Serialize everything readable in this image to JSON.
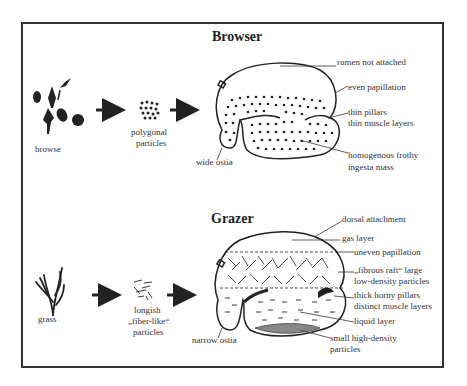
{
  "browser": {
    "title": "Browser",
    "food_label": "browse",
    "particles_label_1": "polygonal",
    "particles_label_2": "particles",
    "annotations": {
      "rumen_not_attached": "rumen not attached",
      "even_papillation": "even papillation",
      "thin_pillars": "thin pillars",
      "thin_muscle_layers": "thin muscle layers",
      "homogenous_1": "homogenous frothy",
      "homogenous_2": "ingesta mass",
      "wide_ostia": "wide ostia"
    }
  },
  "grazer": {
    "title": "Grazer",
    "food_label": "grass",
    "particles_label_1": "longish",
    "particles_label_2": "„fiber-like“",
    "particles_label_3": "particles",
    "annotations": {
      "dorsal_attachment": "dorsal attachment",
      "gas_layer": "gas layer",
      "uneven_papillation": "uneven papillation",
      "fibrous_raft_1": "„fibrous raft“ large",
      "fibrous_raft_2": "low-density particles",
      "thick_pillars_1": "thick horny pillars",
      "thick_pillars_2": "distinct muscle layers",
      "liquid_layer": "liquid layer",
      "small_particles_1": "small high-density",
      "small_particles_2": "particles",
      "narrow_ostia": "narrow ostia"
    }
  }
}
